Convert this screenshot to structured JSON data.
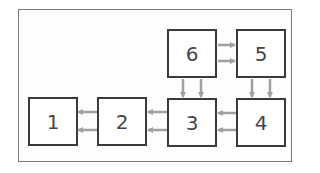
{
  "diagram": {
    "type": "block-flow",
    "colors": {
      "frame": "#7a7a7a",
      "box_border": "#3a3a3a",
      "label": "#454545",
      "arrow": "#a0a0a0"
    },
    "nodes": [
      {
        "id": "1",
        "label": "1",
        "x": 28,
        "y": 97
      },
      {
        "id": "2",
        "label": "2",
        "x": 97,
        "y": 97
      },
      {
        "id": "3",
        "label": "3",
        "x": 167,
        "y": 98
      },
      {
        "id": "4",
        "label": "4",
        "x": 236,
        "y": 98
      },
      {
        "id": "5",
        "label": "5",
        "x": 236,
        "y": 29
      },
      {
        "id": "6",
        "label": "6",
        "x": 167,
        "y": 29
      }
    ],
    "edges": [
      {
        "from": "6",
        "to": "5",
        "count": 2,
        "direction": "right"
      },
      {
        "from": "6",
        "to": "3",
        "count": 2,
        "direction": "down"
      },
      {
        "from": "5",
        "to": "4",
        "count": 2,
        "direction": "down"
      },
      {
        "from": "4",
        "to": "3",
        "count": 2,
        "direction": "left"
      },
      {
        "from": "3",
        "to": "2",
        "count": 2,
        "direction": "left"
      },
      {
        "from": "2",
        "to": "1",
        "count": 2,
        "direction": "left"
      }
    ]
  }
}
